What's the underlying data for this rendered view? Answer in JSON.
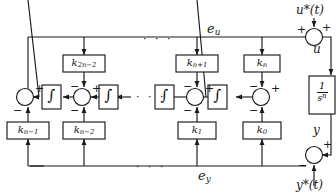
{
  "diagram": {
    "type": "control-block-diagram",
    "stroke_color": "#1a1a1a",
    "background": "#ffffff",
    "ellipsis": "· · ·",
    "signals": {
      "u_ref": "u*(t)",
      "u": "u",
      "y": "y",
      "y_ref": "y*(t)",
      "e_u": "e",
      "e_u_sub": "u",
      "e_y": "e",
      "e_y_sub": "y"
    },
    "gain_blocks": [
      {
        "name": "k-2n-2",
        "base": "k",
        "sub": "2n−2",
        "row": "top"
      },
      {
        "name": "k-n+1",
        "base": "k",
        "sub": "n+1",
        "row": "top"
      },
      {
        "name": "k-n",
        "base": "k",
        "sub": "n",
        "row": "top"
      },
      {
        "name": "k-n-1",
        "base": "k",
        "sub": "n−1",
        "row": "bottom"
      },
      {
        "name": "k-n-2",
        "base": "k",
        "sub": "n−2",
        "row": "bottom"
      },
      {
        "name": "k-1",
        "base": "k",
        "sub": "1",
        "row": "bottom"
      },
      {
        "name": "k-0",
        "base": "k",
        "sub": "0",
        "row": "bottom"
      }
    ],
    "integrators": [
      {
        "name": "integrator-1",
        "glyph": "∫"
      },
      {
        "name": "integrator-2",
        "glyph": "∫"
      },
      {
        "name": "integrator-3",
        "glyph": "∫"
      },
      {
        "name": "integrator-4",
        "glyph": "∫"
      }
    ],
    "plant": {
      "name": "plant-1-over-s-n",
      "numerator": "1",
      "denominator": "s",
      "denominator_exp": "n"
    },
    "summing_junctions": [
      {
        "name": "sum-left",
        "signs": [
          "+",
          "−"
        ]
      },
      {
        "name": "sum-mid-left",
        "signs": [
          "+",
          "−",
          "−"
        ]
      },
      {
        "name": "sum-mid-right",
        "signs": [
          "+",
          "−",
          "−"
        ]
      },
      {
        "name": "sum-right",
        "signs": [
          "+",
          "−",
          "−"
        ]
      },
      {
        "name": "sum-u",
        "signs": [
          "+",
          "+"
        ]
      },
      {
        "name": "sum-y",
        "signs": [
          "+",
          "−"
        ]
      }
    ],
    "plus": "+",
    "minus": "−"
  }
}
